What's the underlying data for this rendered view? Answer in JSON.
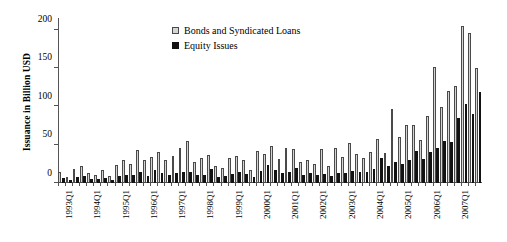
{
  "chart_data": {
    "type": "bar",
    "title": "",
    "xlabel": "",
    "ylabel": "Issuance in Billion USD",
    "ylim": [
      0,
      215
    ],
    "yticks": [
      0,
      50,
      100,
      150,
      200
    ],
    "grid": false,
    "legend_position": "top-center",
    "categories": [
      "1993Q1",
      "1993Q2",
      "1993Q3",
      "1993Q4",
      "1994Q1",
      "1994Q2",
      "1994Q3",
      "1994Q4",
      "1995Q1",
      "1995Q2",
      "1995Q3",
      "1995Q4",
      "1996Q1",
      "1996Q2",
      "1996Q3",
      "1996Q4",
      "1997Q1",
      "1997Q2",
      "1997Q3",
      "1997Q4",
      "1998Q1",
      "1998Q2",
      "1998Q3",
      "1998Q4",
      "1999Q1",
      "1999Q2",
      "1999Q3",
      "1999Q4",
      "2000Q1",
      "2000Q2",
      "2000Q3",
      "2000Q4",
      "2001Q1",
      "2001Q2",
      "2001Q3",
      "2001Q4",
      "2002Q1",
      "2002Q2",
      "2002Q3",
      "2002Q4",
      "2003Q1",
      "2003Q2",
      "2003Q3",
      "2003Q4",
      "2004Q1",
      "2004Q2",
      "2004Q3",
      "2004Q4",
      "2005Q1",
      "2005Q2",
      "2005Q3",
      "2005Q4",
      "2006Q1",
      "2006Q2",
      "2006Q3",
      "2006Q4",
      "2007Q1",
      "2007Q2",
      "2007Q3",
      "2007Q4"
    ],
    "tick_labels": [
      "1993Q1",
      "1994Q1",
      "1995Q1",
      "1996Q1",
      "1997Q1",
      "1998Q1",
      "1999Q1",
      "2000Q1",
      "2001Q1",
      "2002Q1",
      "2003Q1",
      "2004Q1",
      "2005Q1",
      "2006Q1",
      "2007Q1"
    ],
    "series": [
      {
        "name": "Bonds and Syndicated Loans",
        "color": "#d5d5d5",
        "values": [
          15,
          8,
          18,
          22,
          13,
          11,
          17,
          9,
          24,
          30,
          25,
          43,
          30,
          34,
          41,
          30,
          35,
          46,
          55,
          28,
          32,
          37,
          22,
          20,
          33,
          35,
          30,
          17,
          42,
          38,
          48,
          31,
          46,
          44,
          28,
          30,
          25,
          44,
          22,
          46,
          34,
          52,
          38,
          32,
          40,
          57,
          39,
          96,
          60,
          76,
          76,
          56,
          87,
          151,
          99,
          120,
          126,
          205,
          196,
          150
        ]
      },
      {
        "name": "Equity Issues",
        "color": "#121212",
        "values": [
          6,
          4,
          8,
          9,
          5,
          5,
          7,
          4,
          9,
          10,
          11,
          14,
          9,
          17,
          13,
          11,
          13,
          15,
          14,
          10,
          11,
          18,
          8,
          9,
          12,
          14,
          12,
          8,
          16,
          23,
          17,
          13,
          14,
          20,
          10,
          13,
          11,
          12,
          9,
          13,
          13,
          16,
          14,
          15,
          18,
          33,
          22,
          27,
          25,
          30,
          42,
          31,
          41,
          46,
          55,
          53,
          85,
          103,
          90,
          118
        ]
      }
    ]
  },
  "legend": {
    "items": [
      {
        "label": "Bonds and Syndicated Loans",
        "swatch": "bonds"
      },
      {
        "label": "Equity Issues",
        "swatch": "equity"
      }
    ]
  }
}
